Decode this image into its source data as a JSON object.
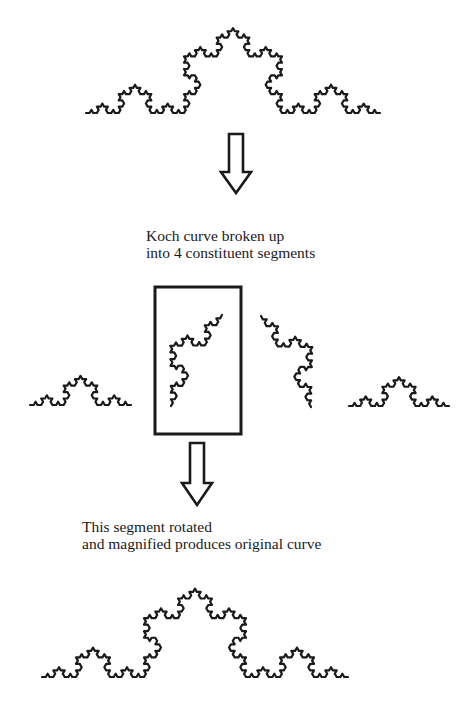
{
  "figure": {
    "stroke_color": "#1a1a1a",
    "background": "#ffffff"
  },
  "curves": {
    "original": {
      "label": "original-koch-curve",
      "start": [
        86,
        113
      ],
      "end": [
        380,
        113
      ],
      "depth": 4
    },
    "segments": [
      {
        "label": "segment-1",
        "start": [
          30,
          405
        ],
        "end": [
          131,
          405
        ],
        "depth": 3
      },
      {
        "label": "segment-2-highlighted",
        "start": [
          171,
          406
        ],
        "end": [
          222,
          315
        ],
        "depth": 3
      },
      {
        "label": "segment-3",
        "start": [
          261,
          316
        ],
        "end": [
          311,
          407
        ],
        "depth": 3
      },
      {
        "label": "segment-4",
        "start": [
          349,
          406
        ],
        "end": [
          449,
          406
        ],
        "depth": 3
      }
    ],
    "reconstructed": {
      "label": "reconstructed-koch-curve",
      "start": [
        42,
        677
      ],
      "end": [
        348,
        677
      ],
      "depth": 4
    }
  },
  "highlight_box": {
    "x": 155,
    "y": 287,
    "width": 86,
    "height": 147
  },
  "arrows": [
    {
      "label": "arrow-down-1",
      "cx": 236,
      "top": 134,
      "shaft_bottom": 172,
      "tip": 193,
      "shaft_half": 7,
      "head_half": 15
    },
    {
      "label": "arrow-down-2",
      "cx": 197,
      "top": 443,
      "shaft_bottom": 483,
      "tip": 505,
      "shaft_half": 7,
      "head_half": 15
    }
  ],
  "captions": {
    "split": {
      "line1": "Koch curve broken up",
      "line2": "into 4 constituent segments"
    },
    "magnify": {
      "line1": "This segment rotated",
      "line2": "and magnified produces original curve"
    }
  }
}
